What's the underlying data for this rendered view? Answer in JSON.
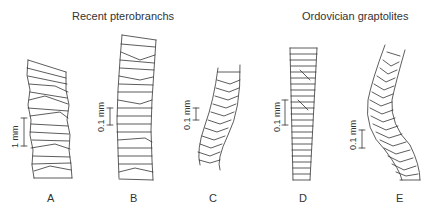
{
  "headings": {
    "left": "Recent pterobranchs",
    "right": "Ordovician graptolites"
  },
  "specimens": [
    {
      "label": "A",
      "group": "Recent pterobranchs",
      "scale": "1 mm"
    },
    {
      "label": "B",
      "group": "Recent pterobranchs",
      "scale": "0.1 mm"
    },
    {
      "label": "C",
      "group": "Recent pterobranchs",
      "scale": "0.1 mm"
    },
    {
      "label": "D",
      "group": "Ordovician graptolites",
      "scale": "0.1 mm"
    },
    {
      "label": "E",
      "group": "Ordovician graptolites",
      "scale": "0.1 mm"
    }
  ],
  "colors": {
    "line": "#333333",
    "background": "#ffffff"
  }
}
